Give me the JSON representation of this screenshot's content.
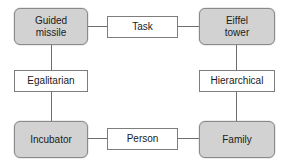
{
  "diagram": {
    "type": "relationship-grid",
    "background_color": "#ffffff",
    "node_fill_corner": "#d2d2d2",
    "node_fill_link": "#ffffff",
    "border_color": "#7d7d7d",
    "connector_color": "#6e6e6e",
    "text_color": "#1a1a1a",
    "nodes": [
      {
        "id": "guided-missile",
        "label": "Guided missile",
        "line1": "Guided",
        "line2": "missile",
        "role": "corner",
        "position": "top-left"
      },
      {
        "id": "task",
        "label": "Task",
        "line1": "Task",
        "line2": "",
        "role": "link",
        "position": "top-center"
      },
      {
        "id": "eiffel-tower",
        "label": "Eiffel tower",
        "line1": "Eiffel",
        "line2": "tower",
        "role": "corner",
        "position": "top-right"
      },
      {
        "id": "egalitarian",
        "label": "Egalitarian",
        "line1": "Egalitarian",
        "line2": "",
        "role": "link",
        "position": "middle-left"
      },
      {
        "id": "hierarchical",
        "label": "Hierarchical",
        "line1": "Hierarchical",
        "line2": "",
        "role": "link",
        "position": "middle-right"
      },
      {
        "id": "incubator",
        "label": "Incubator",
        "line1": "Incubator",
        "line2": "",
        "role": "corner",
        "position": "bottom-left"
      },
      {
        "id": "person",
        "label": "Person",
        "line1": "Person",
        "line2": "",
        "role": "link",
        "position": "bottom-center"
      },
      {
        "id": "family",
        "label": "Family",
        "line1": "Family",
        "line2": "",
        "role": "corner",
        "position": "bottom-right"
      }
    ],
    "connectors": [
      {
        "id": "gm-task",
        "from": "guided-missile",
        "to": "task",
        "orientation": "horizontal"
      },
      {
        "id": "task-et",
        "from": "task",
        "to": "eiffel-tower",
        "orientation": "horizontal"
      },
      {
        "id": "gm-egal",
        "from": "guided-missile",
        "to": "egalitarian",
        "orientation": "vertical"
      },
      {
        "id": "egal-inc",
        "from": "egalitarian",
        "to": "incubator",
        "orientation": "vertical"
      },
      {
        "id": "et-hier",
        "from": "eiffel-tower",
        "to": "hierarchical",
        "orientation": "vertical"
      },
      {
        "id": "hier-fam",
        "from": "hierarchical",
        "to": "family",
        "orientation": "vertical"
      },
      {
        "id": "inc-person",
        "from": "incubator",
        "to": "person",
        "orientation": "horizontal"
      },
      {
        "id": "person-fam",
        "from": "person",
        "to": "family",
        "orientation": "horizontal"
      }
    ]
  }
}
